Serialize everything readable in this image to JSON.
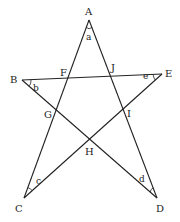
{
  "diagram": {
    "type": "five-pointed star (pentagram) with labeled points and angles",
    "vertices": {
      "A": {
        "label": "A",
        "x": 89,
        "y": 20
      },
      "B": {
        "label": "B",
        "x": 22,
        "y": 80
      },
      "C": {
        "label": "C",
        "x": 24,
        "y": 198
      },
      "D": {
        "label": "D",
        "x": 157,
        "y": 198
      },
      "E": {
        "label": "E",
        "x": 162,
        "y": 74
      }
    },
    "intersections": {
      "F": {
        "label": "F"
      },
      "G": {
        "label": "G"
      },
      "H": {
        "label": "H"
      },
      "I": {
        "label": "I"
      },
      "J": {
        "label": "J"
      }
    },
    "angles": {
      "a": {
        "label": "a",
        "at": "A"
      },
      "b": {
        "label": "b",
        "at": "B"
      },
      "c": {
        "label": "c",
        "at": "C"
      },
      "d": {
        "label": "d",
        "at": "D"
      },
      "e": {
        "label": "e",
        "at": "E"
      }
    },
    "segments": [
      "AC",
      "AD",
      "BE",
      "BD",
      "CE"
    ]
  }
}
